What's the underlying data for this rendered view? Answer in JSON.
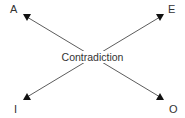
{
  "diagram": {
    "center_label": "Contradiction",
    "corners": {
      "top_left": "A",
      "top_right": "E",
      "bottom_left": "I",
      "bottom_right": "O"
    },
    "colors": {
      "line": "#4a4a4a",
      "arrowhead": "#111111",
      "text": "#333333"
    }
  }
}
